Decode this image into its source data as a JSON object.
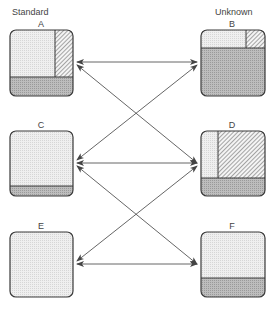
{
  "columns": {
    "left": "Standard",
    "right": "Unknown"
  },
  "boxes": [
    {
      "id": "A",
      "label": "A",
      "column": "Standard",
      "composition": {
        "light": "upper-left",
        "hatched": "upper-right strip",
        "dark": "bottom band"
      }
    },
    {
      "id": "B",
      "label": "B",
      "column": "Unknown",
      "composition": {
        "light": "top band left",
        "hatched": "top band right",
        "dark": "large lower area"
      }
    },
    {
      "id": "C",
      "label": "C",
      "column": "Standard",
      "composition": {
        "light": "most of box",
        "dark": "thin bottom band"
      }
    },
    {
      "id": "D",
      "label": "D",
      "column": "Unknown",
      "composition": {
        "light": "narrow left column",
        "hatched": "large upper-right area",
        "dark": "bottom band"
      }
    },
    {
      "id": "E",
      "label": "E",
      "column": "Standard",
      "composition": {
        "light": "entire box"
      }
    },
    {
      "id": "F",
      "label": "F",
      "column": "Unknown",
      "composition": {
        "light": "upper area",
        "dark": "bottom band"
      }
    }
  ],
  "connections": [
    {
      "from": "A",
      "to": "B",
      "type": "double-arrow"
    },
    {
      "from": "A",
      "to": "D",
      "type": "double-arrow"
    },
    {
      "from": "C",
      "to": "B",
      "type": "double-arrow"
    },
    {
      "from": "C",
      "to": "D",
      "type": "double-arrow"
    },
    {
      "from": "C",
      "to": "F",
      "type": "double-arrow"
    },
    {
      "from": "E",
      "to": "D",
      "type": "double-arrow"
    },
    {
      "from": "E",
      "to": "F",
      "type": "double-arrow"
    }
  ],
  "colors": {
    "light_fill": "#ebebeb",
    "dark_fill": "#b4b4b4",
    "outline": "#3a3a3a",
    "line": "#555555"
  }
}
